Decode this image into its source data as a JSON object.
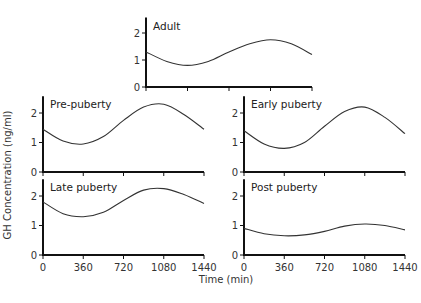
{
  "chart_data": [
    {
      "type": "line",
      "title": "Adult",
      "xlabel": "Time (min)",
      "ylabel": "GH Concentration (ng/ml)",
      "x_ticks": [
        0,
        360,
        720,
        1080,
        1440
      ],
      "y_ticks": [
        0,
        1,
        2
      ],
      "xlim": [
        0,
        1440
      ],
      "ylim": [
        0,
        2.5
      ],
      "x": [
        0,
        180,
        360,
        540,
        720,
        900,
        1080,
        1260,
        1440
      ],
      "values": [
        1.3,
        0.95,
        0.8,
        0.95,
        1.3,
        1.6,
        1.75,
        1.6,
        1.2
      ]
    },
    {
      "type": "line",
      "title": "Pre-puberty",
      "xlabel": "Time (min)",
      "ylabel": "GH Concentration (ng/ml)",
      "x_ticks": [
        0,
        360,
        720,
        1080,
        1440
      ],
      "y_ticks": [
        0,
        1,
        2
      ],
      "xlim": [
        0,
        1440
      ],
      "ylim": [
        0,
        2.5
      ],
      "x": [
        0,
        180,
        360,
        540,
        720,
        900,
        1080,
        1260,
        1440
      ],
      "values": [
        1.45,
        1.05,
        0.95,
        1.2,
        1.75,
        2.2,
        2.3,
        1.95,
        1.45
      ]
    },
    {
      "type": "line",
      "title": "Early puberty",
      "xlabel": "Time (min)",
      "ylabel": "GH Concentration (ng/ml)",
      "x_ticks": [
        0,
        360,
        720,
        1080,
        1440
      ],
      "y_ticks": [
        0,
        1,
        2
      ],
      "xlim": [
        0,
        1440
      ],
      "ylim": [
        0,
        2.5
      ],
      "x": [
        0,
        180,
        360,
        540,
        720,
        900,
        1080,
        1260,
        1440
      ],
      "values": [
        1.4,
        0.95,
        0.8,
        1.0,
        1.55,
        2.05,
        2.2,
        1.85,
        1.3
      ]
    },
    {
      "type": "line",
      "title": "Late puberty",
      "xlabel": "Time (min)",
      "ylabel": "GH Concentration (ng/ml)",
      "x_ticks": [
        0,
        360,
        720,
        1080,
        1440
      ],
      "y_ticks": [
        0,
        1,
        2
      ],
      "xlim": [
        0,
        1440
      ],
      "ylim": [
        0,
        2.5
      ],
      "x": [
        0,
        180,
        360,
        540,
        720,
        900,
        1080,
        1260,
        1440
      ],
      "values": [
        1.8,
        1.4,
        1.3,
        1.45,
        1.85,
        2.2,
        2.25,
        2.05,
        1.75
      ]
    },
    {
      "type": "line",
      "title": "Post puberty",
      "xlabel": "Time (min)",
      "ylabel": "GH Concentration (ng/ml)",
      "x_ticks": [
        0,
        360,
        720,
        1080,
        1440
      ],
      "y_ticks": [
        0,
        1,
        2
      ],
      "xlim": [
        0,
        1440
      ],
      "ylim": [
        0,
        2.5
      ],
      "x": [
        0,
        180,
        360,
        540,
        720,
        900,
        1080,
        1260,
        1440
      ],
      "values": [
        0.9,
        0.72,
        0.65,
        0.68,
        0.8,
        0.98,
        1.05,
        1.0,
        0.85
      ]
    }
  ],
  "labels": {
    "ylabel": "GH Concentration (ng/ml)",
    "xlabel": "Time (min)"
  },
  "panels": [
    {
      "id": "adult",
      "title": "Adult",
      "x0": 146,
      "x1": 312,
      "y0": 87,
      "yunit": 27,
      "show_x_labels": false
    },
    {
      "id": "pre-puberty",
      "title": "Pre-puberty",
      "x0": 43,
      "x1": 204,
      "y0": 172,
      "yunit": 29.5,
      "show_x_labels": false
    },
    {
      "id": "early-puberty",
      "title": "Early puberty",
      "x0": 244,
      "x1": 405,
      "y0": 172,
      "yunit": 29.5,
      "show_x_labels": false
    },
    {
      "id": "late-puberty",
      "title": "Late puberty",
      "x0": 43,
      "x1": 204,
      "y0": 255,
      "yunit": 29.5,
      "show_x_labels": true
    },
    {
      "id": "post-puberty",
      "title": "Post puberty",
      "x0": 244,
      "x1": 405,
      "y0": 255,
      "yunit": 29.5,
      "show_x_labels": true
    }
  ]
}
